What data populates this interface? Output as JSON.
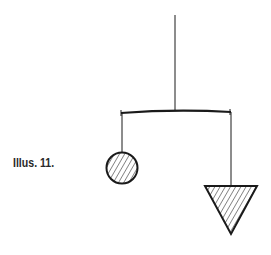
{
  "caption": {
    "text": "Illus. 11."
  },
  "figure": {
    "stroke_color": "#1a1a1a",
    "hatch_color": "#333333",
    "elements": [
      {
        "type": "string",
        "name": "top-suspension-string"
      },
      {
        "type": "bar",
        "name": "balance-bar"
      },
      {
        "type": "string",
        "name": "left-hanging-string"
      },
      {
        "type": "circle",
        "name": "hatched-circle-weight",
        "fill": "diagonal-hatch"
      },
      {
        "type": "string",
        "name": "right-hanging-string"
      },
      {
        "type": "triangle",
        "name": "hatched-triangle-weight",
        "orientation": "inverted",
        "fill": "diagonal-hatch"
      }
    ]
  }
}
